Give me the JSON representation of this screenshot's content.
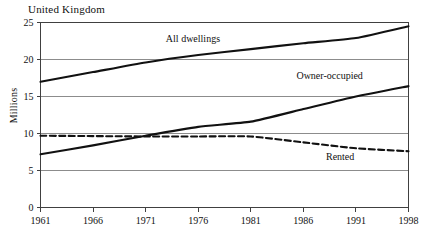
{
  "figure": {
    "title": "United Kingdom",
    "ylabel": "Millions"
  },
  "axes": {
    "y_ticks": [
      "0",
      "5",
      "10",
      "15",
      "20",
      "25"
    ],
    "x_ticks": [
      "1961",
      "1966",
      "1971",
      "1976",
      "1981",
      "1986",
      "1991",
      "1998"
    ]
  },
  "series_labels": {
    "all_dwellings": "All dwellings",
    "owner_occupied": "Owner-occupied",
    "rented": "Rented"
  },
  "colors": {
    "line": "#111111",
    "grid": "#808080",
    "axis": "#404040",
    "background": "#ffffff"
  },
  "chart_data": {
    "type": "line",
    "title": "United Kingdom",
    "subtitle": "",
    "xlabel": "",
    "ylabel": "Millions",
    "xlim": [
      1961,
      1998
    ],
    "ylim": [
      0,
      25
    ],
    "grid": true,
    "legend_position": "inline-annotations",
    "x_tick_labels": [
      "1961",
      "1966",
      "1971",
      "1976",
      "1981",
      "1986",
      "1991",
      "1998"
    ],
    "y_tick_labels": [
      "0",
      "5",
      "10",
      "15",
      "20",
      "25"
    ],
    "x": [
      1961,
      1966,
      1971,
      1976,
      1981,
      1986,
      1991,
      1998
    ],
    "series": [
      {
        "name": "All dwellings",
        "style": "solid",
        "values": [
          17.0,
          18.3,
          19.6,
          20.6,
          21.4,
          22.2,
          22.9,
          24.5
        ],
        "label_x": 1975.5,
        "label_y": 22.3
      },
      {
        "name": "Owner-occupied",
        "style": "solid",
        "values": [
          7.2,
          8.4,
          9.7,
          10.9,
          11.6,
          13.3,
          15.0,
          16.4
        ],
        "label_x": 1988.5,
        "label_y": 17.3
      },
      {
        "name": "Rented",
        "style": "dashed",
        "values": [
          9.7,
          9.65,
          9.6,
          9.6,
          9.6,
          8.8,
          8.0,
          7.6
        ],
        "label_x": 1989.5,
        "label_y": 6.4
      }
    ]
  }
}
